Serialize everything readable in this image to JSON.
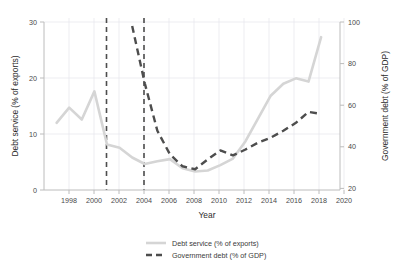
{
  "chart_data": {
    "type": "line",
    "title": "",
    "subtitle": "",
    "xlabel": "Year",
    "ylabel": "Debt service (% of exports)",
    "y2label": "Government debt (% of GDP)",
    "xlim": [
      1997,
      2020.5
    ],
    "ylim": [
      0,
      31
    ],
    "y2lim": [
      18,
      103
    ],
    "xticks": [
      1998,
      2000,
      2002,
      2004,
      2006,
      2008,
      2010,
      2012,
      2014,
      2016,
      2018,
      2020
    ],
    "xtick_labels": [
      "1998",
      "2000",
      "2002",
      "2004",
      "2006",
      "2008",
      "2010",
      "2012",
      "2014",
      "2016",
      "2018",
      "2020"
    ],
    "yticks": [
      0,
      10,
      20,
      30
    ],
    "ytick_labels": [
      "0",
      "10",
      "20",
      "30"
    ],
    "y2ticks": [
      20,
      40,
      60,
      80,
      100
    ],
    "y2tick_labels": [
      "20",
      "40",
      "60",
      "80",
      "100"
    ],
    "grid": true,
    "legend_position": "bottom",
    "annotations": {
      "vertical_reference_lines": [
        2001,
        2004
      ]
    },
    "series": [
      {
        "name": "Debt service (% of exports)",
        "axis": "left",
        "color": "#d5d5d5",
        "style": "solid",
        "x": [
          1998,
          1999,
          2000,
          2001,
          2002,
          2003,
          2004,
          2005,
          2006,
          2007,
          2008,
          2009,
          2010,
          2011,
          2012,
          2013,
          2014,
          2015,
          2016,
          2017,
          2018,
          2019
        ],
        "values": [
          12.4,
          15.2,
          13.0,
          18.2,
          8.4,
          7.8,
          6.0,
          4.8,
          5.3,
          5.7,
          4.0,
          3.4,
          3.6,
          4.6,
          5.8,
          9.0,
          13.2,
          17.4,
          19.6,
          20.6,
          20.0,
          28.2
        ]
      },
      {
        "name": "Government debt (% of GDP)",
        "axis": "right",
        "color": "#4d4d4d",
        "style": "dashed",
        "x": [
          2004,
          2005,
          2006,
          2007,
          2008,
          2009,
          2010,
          2011,
          2012,
          2013,
          2014,
          2015,
          2016,
          2017,
          2018,
          2019
        ],
        "values": [
          101.0,
          72.0,
          48.0,
          36.0,
          30.0,
          28.5,
          33.5,
          38.0,
          35.5,
          38.5,
          42.0,
          44.5,
          48.0,
          52.0,
          57.5,
          56.5
        ]
      }
    ],
    "legend": [
      {
        "label": "Debt service (% of exports)",
        "style": "solid",
        "color": "#d5d5d5"
      },
      {
        "label": "Government debt (% of GDP)",
        "style": "dashed",
        "color": "#4d4d4d"
      }
    ]
  }
}
